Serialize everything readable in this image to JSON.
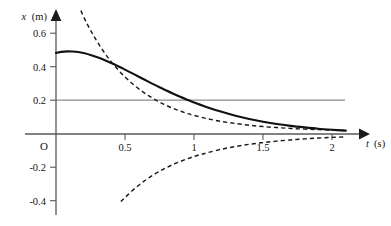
{
  "chart_data": {
    "type": "line",
    "title": "",
    "subtitle": "",
    "xlabel": "t (s)",
    "ylabel": "x (m)",
    "xlabel_variable": "t",
    "xlabel_unit": "(s)",
    "ylabel_variable": "x",
    "ylabel_unit": "(m)",
    "origin_label": "O",
    "xlim": [
      -0.06,
      2.3
    ],
    "ylim": [
      -0.47,
      0.72
    ],
    "grid": false,
    "legend": "none",
    "x_ticks": [
      0.5,
      1,
      1.5,
      2
    ],
    "x_tick_labels": [
      "0.5",
      "1",
      "1.5",
      "2"
    ],
    "y_ticks": [
      0.6,
      0.4,
      0.2,
      -0.2,
      -0.4
    ],
    "y_tick_labels": [
      "0.6",
      "0.4",
      "0.2",
      "-0.2",
      "-0.4"
    ],
    "reference_lines": [
      {
        "name": "x = 0.2 m reference",
        "orientation": "horizontal",
        "value": 0.2,
        "style": "solid",
        "color": "#8d8d8d",
        "x_start": 0.0,
        "x_end": 2.1
      }
    ],
    "series": [
      {
        "name": "solid-response",
        "style": "solid",
        "color": "#111111",
        "x": [
          0.0,
          0.04,
          0.08,
          0.12,
          0.16,
          0.2,
          0.25,
          0.3,
          0.35,
          0.4,
          0.45,
          0.5,
          0.55,
          0.6,
          0.65,
          0.7,
          0.75,
          0.8,
          0.85,
          0.9,
          0.95,
          1.0,
          1.1,
          1.2,
          1.3,
          1.4,
          1.5,
          1.6,
          1.7,
          1.8,
          1.9,
          2.0,
          2.1
        ],
        "y": [
          0.48,
          0.486,
          0.489,
          0.488,
          0.485,
          0.479,
          0.468,
          0.454,
          0.438,
          0.42,
          0.401,
          0.381,
          0.36,
          0.339,
          0.318,
          0.297,
          0.277,
          0.257,
          0.238,
          0.22,
          0.203,
          0.187,
          0.157,
          0.131,
          0.108,
          0.089,
          0.073,
          0.059,
          0.048,
          0.039,
          0.031,
          0.025,
          0.02
        ]
      },
      {
        "name": "dashed-upper-branch",
        "style": "dashed",
        "color": "#1a1a1a",
        "x": [
          0.18,
          0.22,
          0.26,
          0.3,
          0.35,
          0.4,
          0.45,
          0.5,
          0.55,
          0.6,
          0.65,
          0.7,
          0.75,
          0.8,
          0.85,
          0.9,
          0.95,
          1.0,
          1.1,
          1.2,
          1.3,
          1.4,
          1.5,
          1.6,
          1.7,
          1.8,
          1.9,
          2.0,
          2.1
        ],
        "y": [
          0.73,
          0.66,
          0.6,
          0.545,
          0.482,
          0.428,
          0.38,
          0.338,
          0.3,
          0.267,
          0.238,
          0.212,
          0.189,
          0.169,
          0.151,
          0.136,
          0.122,
          0.11,
          0.09,
          0.074,
          0.062,
          0.052,
          0.044,
          0.038,
          0.033,
          0.029,
          0.026,
          0.023,
          0.021
        ]
      },
      {
        "name": "dashed-lower-branch",
        "style": "dashed",
        "color": "#1a1a1a",
        "x": [
          0.47,
          0.5,
          0.55,
          0.6,
          0.65,
          0.7,
          0.75,
          0.8,
          0.85,
          0.9,
          0.95,
          1.0,
          1.05,
          1.1,
          1.2,
          1.3,
          1.4,
          1.5,
          1.6,
          1.7,
          1.8,
          1.9,
          2.0,
          2.1
        ],
        "y": [
          -0.4,
          -0.376,
          -0.337,
          -0.303,
          -0.272,
          -0.245,
          -0.221,
          -0.199,
          -0.18,
          -0.163,
          -0.147,
          -0.133,
          -0.121,
          -0.11,
          -0.09,
          -0.074,
          -0.061,
          -0.051,
          -0.042,
          -0.035,
          -0.029,
          -0.024,
          -0.02,
          -0.017
        ]
      }
    ],
    "annotations": []
  }
}
